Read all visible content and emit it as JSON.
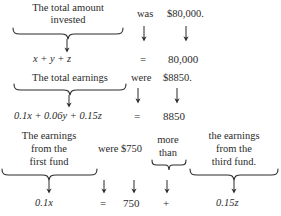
{
  "document": {
    "type": "word-problem-translation-diagram",
    "background_color": "#ffffff",
    "text_color": "#2b2b2b"
  },
  "rows": [
    {
      "id": "row-1",
      "phrase_lines": [
        "The total amount",
        "invested"
      ],
      "verb": "was",
      "value_text": "$80,000.",
      "equation": {
        "left": "x + y + z",
        "relation": "=",
        "right": "80,000"
      }
    },
    {
      "id": "row-2",
      "phrase_lines": [
        "The total earnings"
      ],
      "verb": "were",
      "value_text": "$8850.",
      "equation": {
        "left": "0.1x + 0.06y + 0.15z",
        "relation": "=",
        "right": "8850"
      }
    },
    {
      "id": "row-3",
      "phrase_lines": [
        "The earnings",
        "from the",
        "first fund"
      ],
      "verb": "were $750",
      "comparator_lines": [
        "more",
        "than"
      ],
      "phrase2_lines": [
        "the earnings",
        "from the",
        "third fund."
      ],
      "equation": {
        "left": "0.1x",
        "relation": "=",
        "value": "750",
        "plus": "+",
        "right": "0.15z"
      }
    }
  ],
  "icons": {
    "down_arrow": "down-arrow-icon",
    "under_brace": "under-brace-icon"
  }
}
